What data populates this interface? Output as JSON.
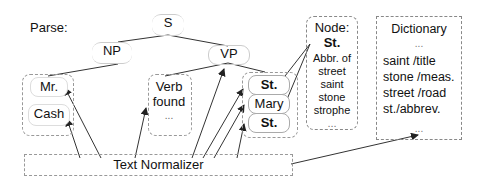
{
  "diagram": {
    "parse_label": "Parse:",
    "tree": {
      "root": "S",
      "np": "NP",
      "vp": "VP",
      "np_children": [
        "Mr.",
        "Cash"
      ],
      "verb_group": {
        "title": "Verb",
        "value": "found",
        "ellipsis": "..."
      },
      "vp_children": [
        "St.",
        "Mary",
        "St."
      ]
    },
    "node_panel": {
      "title": "Node:",
      "value": "St.",
      "lines": [
        "Abbr. of",
        "street",
        "saint",
        "stone",
        "strophe",
        "..."
      ]
    },
    "dictionary": {
      "title": "Dictionary",
      "lines": [
        "...",
        "saint /title",
        "stone /meas.",
        "street /road",
        "st./abbrev.",
        "..."
      ]
    },
    "normalizer": {
      "label": "Text Normalizer"
    },
    "colors": {
      "line": "#222222",
      "dashed_border": "#999999",
      "background": "#ffffff"
    }
  }
}
